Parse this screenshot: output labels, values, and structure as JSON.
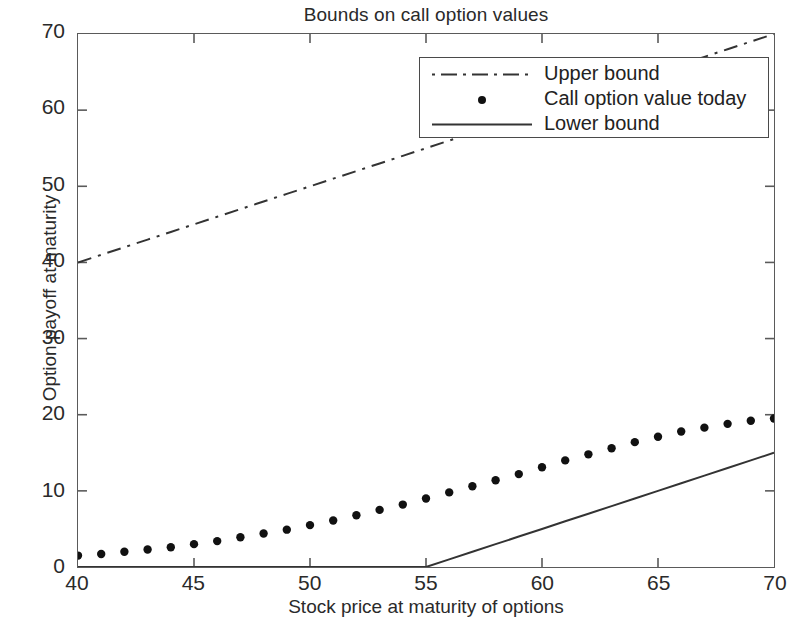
{
  "chart_data": {
    "type": "line",
    "title": "Bounds on call option values",
    "xlabel": "Stock price at maturity of options",
    "ylabel": "Option payoff at maturity",
    "xlim": [
      40,
      70
    ],
    "ylim": [
      0,
      70
    ],
    "xticks": [
      40,
      45,
      50,
      55,
      60,
      65,
      70
    ],
    "yticks": [
      0,
      10,
      20,
      30,
      40,
      50,
      60,
      70
    ],
    "grid": false,
    "legend_position": "upper center",
    "x": [
      40,
      41,
      42,
      43,
      44,
      45,
      46,
      47,
      48,
      49,
      50,
      51,
      52,
      53,
      54,
      55,
      56,
      57,
      58,
      59,
      60,
      61,
      62,
      63,
      64,
      65,
      66,
      67,
      68,
      69,
      70
    ],
    "series": [
      {
        "name": "Upper bound",
        "style": "dash-dot",
        "marker": "none",
        "color": "#333333",
        "values": [
          40,
          41,
          42,
          43,
          44,
          45,
          46,
          47,
          48,
          49,
          50,
          51,
          52,
          53,
          54,
          55,
          56,
          57,
          58,
          59,
          60,
          61,
          62,
          63,
          64,
          65,
          66,
          67,
          68,
          69,
          70
        ]
      },
      {
        "name": "Call option value today",
        "style": "none",
        "marker": "dot",
        "color": "#111111",
        "values": [
          1.5,
          1.7,
          2.0,
          2.3,
          2.6,
          3.0,
          3.4,
          3.9,
          4.4,
          4.9,
          5.5,
          6.1,
          6.8,
          7.5,
          8.2,
          9.0,
          9.8,
          10.6,
          11.4,
          12.2,
          13.1,
          14.0,
          14.8,
          15.6,
          16.4,
          17.1,
          17.8,
          18.3,
          18.8,
          19.2,
          19.5
        ]
      },
      {
        "name": "Lower bound",
        "style": "solid",
        "marker": "none",
        "color": "#333333",
        "values": [
          0,
          0,
          0,
          0,
          0,
          0,
          0,
          0,
          0,
          0,
          0,
          0,
          0,
          0,
          0,
          0,
          1,
          2,
          3,
          4,
          5,
          6,
          7,
          8,
          9,
          10,
          11,
          12,
          13,
          14,
          15
        ]
      }
    ],
    "annotations": [
      "Upper bound equals the stock price (slope 1, intercept 0)",
      "Lower bound equals max(stock price - 55, 0)"
    ]
  },
  "legend": {
    "items": [
      {
        "label": "Upper bound",
        "sample": "dash-dot-line-sample"
      },
      {
        "label": "Call option value today",
        "sample": "dot-marker-sample"
      },
      {
        "label": "Lower bound",
        "sample": "solid-line-sample"
      }
    ]
  },
  "colors": {
    "background": "#ffffff",
    "axis": "#5a5a5a",
    "text": "#2a2a2a",
    "data": "#333333",
    "marker": "#111111"
  }
}
